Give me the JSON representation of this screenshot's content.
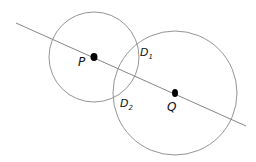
{
  "diagram": {
    "line": {
      "x1": 16,
      "y1": 23,
      "x2": 246,
      "y2": 126,
      "color": "#777777"
    },
    "circles": [
      {
        "name": "circle-P",
        "cx": 94,
        "cy": 57,
        "r": 45,
        "color": "#888888"
      },
      {
        "name": "circle-Q",
        "cx": 175,
        "cy": 93,
        "r": 62,
        "color": "#888888"
      }
    ],
    "points": [
      {
        "name": "P",
        "cx": 94,
        "cy": 57,
        "label": "P",
        "lx": 78,
        "ly": 66
      },
      {
        "name": "Q",
        "cx": 175,
        "cy": 93,
        "label": "Q",
        "lx": 167,
        "ly": 111
      }
    ],
    "intersections": [
      {
        "name": "D1",
        "label": "D",
        "sub": "1",
        "lx": 140,
        "ly": 56
      },
      {
        "name": "D2",
        "label": "D",
        "sub": "2",
        "lx": 120,
        "ly": 107
      }
    ]
  }
}
